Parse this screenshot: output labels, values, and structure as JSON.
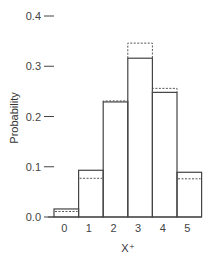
{
  "chart_data": {
    "type": "bar",
    "title": "",
    "xlabel": "X⁺",
    "ylabel": "Probability",
    "categories": [
      "0",
      "1",
      "2",
      "3",
      "4",
      "5"
    ],
    "series": [
      {
        "name": "observed",
        "style": "solid",
        "values": [
          0.016,
          0.093,
          0.229,
          0.316,
          0.248,
          0.089
        ]
      },
      {
        "name": "expected",
        "style": "dashed",
        "values": [
          0.011,
          0.077,
          0.231,
          0.346,
          0.256,
          0.076
        ]
      }
    ],
    "yticks": [
      "0.0",
      "0.1",
      "0.2",
      "0.3",
      "0.4"
    ],
    "ylim": [
      0,
      0.4
    ],
    "grid": false,
    "legend": "none"
  }
}
